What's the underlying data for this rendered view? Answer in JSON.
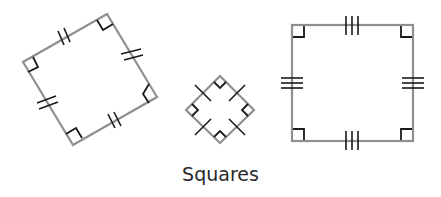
{
  "caption": "Squares",
  "shapes": [
    {
      "name": "tilted-square",
      "tick_marks_per_side": 2,
      "right_angle_marks": 4
    },
    {
      "name": "small-diamond-square",
      "tick_marks_per_side": 1,
      "right_angle_marks": 4
    },
    {
      "name": "upright-square",
      "tick_marks_per_side": 3,
      "right_angle_marks": 4
    }
  ],
  "colors": {
    "side": "#8f8f8f",
    "mark": "#1a1a1a"
  }
}
